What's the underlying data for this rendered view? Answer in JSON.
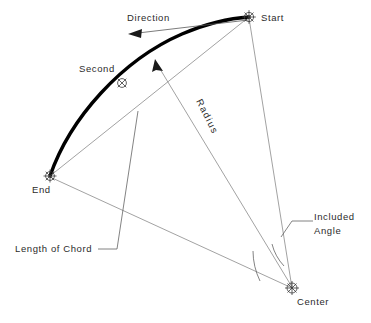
{
  "diagram": {
    "background_color": "#ffffff",
    "line_color": "#7a7a7a",
    "arc_color": "#000000",
    "text_color": "#2b2b2b",
    "width": 371,
    "height": 323
  },
  "labels": {
    "start": "Start",
    "second": "Second",
    "end": "End",
    "center": "Center",
    "direction": "Direction",
    "radius": "Radius",
    "length_of_chord": "Length of Chord",
    "included": "Included",
    "angle": "Angle"
  },
  "points": {
    "start": {
      "name": "Start",
      "x": 249,
      "y": 17
    },
    "second": {
      "name": "Second",
      "x": 122,
      "y": 83
    },
    "end": {
      "name": "End",
      "x": 50,
      "y": 176
    },
    "center": {
      "name": "Center",
      "x": 292,
      "y": 288
    }
  },
  "elements": {
    "arc": "thick black circular arc from End through Second to Start",
    "radius_start": "thin line from Start to Center",
    "radius_end": "thin line from End to Center",
    "chord": "thin line from End to Start",
    "direction_arrow": "arrow pointing left along tangent near Start",
    "arc_direction_arrow": "arrowhead on arc pointing toward Start",
    "included_angle_arcs": "two small arcs at Center between the two radii"
  }
}
